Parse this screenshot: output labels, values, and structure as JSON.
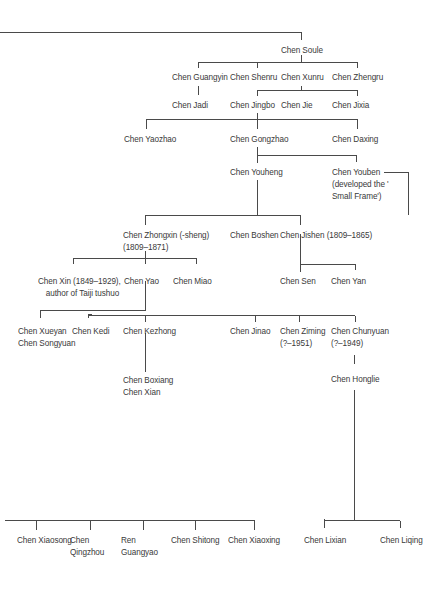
{
  "diagram": {
    "type": "family-tree",
    "line_color": "#4a4a4a",
    "text_color": "#3a3a3a",
    "nodes": {
      "soule": {
        "line1": "Chen Soule"
      },
      "guangyin": {
        "line1": "Chen Guangyin"
      },
      "shenru": {
        "line1": "Chen Shenru"
      },
      "xunru": {
        "line1": "Chen Xunru"
      },
      "zhengru": {
        "line1": "Chen Zhengru"
      },
      "jadi": {
        "line1": "Chen Jadi"
      },
      "jingbo": {
        "line1": "Chen Jingbo"
      },
      "jie": {
        "line1": "Chen Jie"
      },
      "jixia": {
        "line1": "Chen Jixia"
      },
      "yaozhao": {
        "line1": "Chen Yaozhao"
      },
      "gongzhao": {
        "line1": "Chen Gongzhao"
      },
      "daxing": {
        "line1": "Chen Daxing"
      },
      "youheng": {
        "line1": "Chen Youheng"
      },
      "youben": {
        "line1": "Chen Youben",
        "line2": "(developed the '",
        "line3": "Small Frame')"
      },
      "zhongxin": {
        "line1": "Chen Zhongxin (-sheng)",
        "line2": "(1809–1871)"
      },
      "boshen": {
        "line1": "Chen Boshen"
      },
      "jishen": {
        "line1": "Chen Jishen (1809–1865)"
      },
      "xin": {
        "line1": "Chen Xin (1849–1929),",
        "line2": "author of Taiji tushuo"
      },
      "yao": {
        "line1": "Chen Yao"
      },
      "miao": {
        "line1": "Chen Miao"
      },
      "sen": {
        "line1": "Chen Sen"
      },
      "yan": {
        "line1": "Chen Yan"
      },
      "xueyan": {
        "line1": "Chen Xueyan",
        "line2": "Chen Songyuan"
      },
      "kedi": {
        "line1": "Chen Kedi"
      },
      "kezhong": {
        "line1": "Chen Kezhong"
      },
      "jinao": {
        "line1": "Chen Jinao"
      },
      "ziming": {
        "line1": "Chen Ziming",
        "line2": "(?–1951)"
      },
      "chunyuan": {
        "line1": "Chen Chunyuan",
        "line2": "(?–1949)"
      },
      "boxiang": {
        "line1": "Chen Boxiang",
        "line2": "Chen Xian"
      },
      "honglie": {
        "line1": "Chen Honglie"
      },
      "xiaosong": {
        "line1": "Chen Xiaosong"
      },
      "qingzhou": {
        "line1": "Chen",
        "line2": "Qingzhou"
      },
      "guangyao": {
        "line1": "Ren",
        "line2": "Guangyao"
      },
      "shitong": {
        "line1": "Chen Shitong"
      },
      "xiaoxing": {
        "line1": "Chen Xiaoxing"
      },
      "lixian": {
        "line1": "Chen Lixian"
      },
      "liqing": {
        "line1": "Chen Liqing"
      }
    }
  }
}
